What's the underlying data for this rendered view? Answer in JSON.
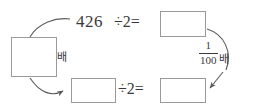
{
  "diagram": {
    "type": "division-by-two-flow",
    "dividend": "426",
    "top_expression": "÷2=",
    "bottom_expression": "÷2=",
    "multiplier_label": "배",
    "fraction": {
      "numerator": "1",
      "denominator": "100",
      "unit_label": "배"
    },
    "boxes": [
      {
        "name": "box-left",
        "value": ""
      },
      {
        "name": "box-top-right",
        "value": ""
      },
      {
        "name": "box-bottom-left",
        "value": ""
      },
      {
        "name": "box-bottom-right",
        "value": ""
      }
    ],
    "colors": {
      "background": "#ffffff",
      "ink": "#3a3a3a",
      "box_border": "#9a9a9a",
      "arrow": "#5a5a5a"
    }
  }
}
